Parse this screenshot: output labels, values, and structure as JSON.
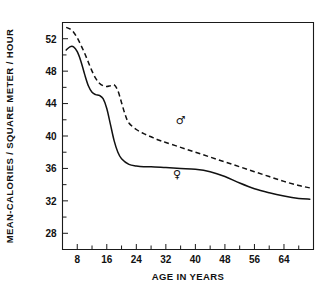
{
  "chart_data": {
    "type": "line",
    "title": "",
    "xlabel": "AGE IN YEARS",
    "ylabel": "MEAN-CALORIES / SQUARE METER / HOUR",
    "xlim": [
      4,
      72
    ],
    "ylim": [
      26,
      54
    ],
    "xticks": [
      8,
      16,
      24,
      32,
      40,
      48,
      56,
      64
    ],
    "xtick_labels": [
      "8",
      "16",
      "24",
      "32",
      "40",
      "48",
      "56",
      "64"
    ],
    "yticks": [
      28,
      32,
      36,
      40,
      44,
      48,
      52
    ],
    "ytick_labels": [
      "28",
      "32",
      "36",
      "40",
      "44",
      "48",
      "52"
    ],
    "minor_x_interval": 4,
    "minor_y_interval": 2,
    "grid": false,
    "legend_position": "inline-annotation",
    "series": [
      {
        "name": "male",
        "symbol": "♂",
        "style": "dashed",
        "annotation_x": 36,
        "annotation_y": 41.5,
        "x": [
          5,
          6,
          7,
          8,
          9,
          10,
          11,
          12,
          13,
          14,
          15,
          16,
          17,
          18,
          19,
          20,
          21,
          22,
          24,
          26,
          28,
          30,
          32,
          36,
          40,
          44,
          48,
          52,
          56,
          60,
          64,
          68,
          71
        ],
        "y": [
          53.4,
          53.2,
          52.8,
          52.1,
          51.2,
          50.2,
          49.1,
          48.0,
          47.1,
          46.5,
          46.2,
          46.1,
          46.2,
          46.3,
          45.6,
          44.1,
          42.6,
          41.6,
          40.8,
          40.3,
          39.9,
          39.5,
          39.2,
          38.6,
          38.0,
          37.4,
          36.8,
          36.2,
          35.6,
          35.0,
          34.4,
          33.9,
          33.6
        ]
      },
      {
        "name": "female",
        "symbol": "♀",
        "style": "solid",
        "annotation_x": 35,
        "annotation_y": 34.8,
        "x": [
          5,
          6,
          7,
          8,
          9,
          10,
          11,
          12,
          13,
          14,
          15,
          16,
          17,
          18,
          19,
          20,
          22,
          24,
          26,
          28,
          32,
          36,
          40,
          44,
          48,
          52,
          56,
          60,
          64,
          68,
          71
        ],
        "y": [
          50.6,
          51.0,
          51.0,
          50.4,
          49.2,
          47.6,
          46.2,
          45.4,
          45.1,
          45.0,
          44.6,
          43.4,
          41.4,
          39.4,
          38.0,
          37.2,
          36.5,
          36.3,
          36.2,
          36.2,
          36.1,
          36.0,
          35.9,
          35.6,
          35.0,
          34.2,
          33.5,
          33.0,
          32.6,
          32.3,
          32.2
        ]
      }
    ]
  }
}
